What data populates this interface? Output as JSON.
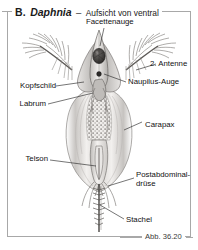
{
  "figure": {
    "panel_letter": "B.",
    "genus": "Daphnia",
    "dash": "–",
    "view": "Aufsicht von ventral",
    "caption": "Abb. 36.20",
    "style": "grayscale-scientific-illustration"
  },
  "labels": [
    {
      "key": "facettenauge",
      "text": "Facettenauge",
      "side": "top"
    },
    {
      "key": "antenne2",
      "text": "2. Antenne",
      "side": "right"
    },
    {
      "key": "naupilus_auge",
      "text": "Naupilus-Auge",
      "side": "right"
    },
    {
      "key": "kopfschild",
      "text": "Kopfschild",
      "side": "left"
    },
    {
      "key": "labrum",
      "text": "Labrum",
      "side": "left"
    },
    {
      "key": "carapax",
      "text": "Carapax",
      "side": "right"
    },
    {
      "key": "telson",
      "text": "Telson",
      "side": "left"
    },
    {
      "key": "postabdominal_1",
      "text": "Postabdominal-",
      "side": "right"
    },
    {
      "key": "postabdominal_2",
      "text": "drüse",
      "side": "right"
    },
    {
      "key": "stachel",
      "text": "Stachel",
      "side": "right"
    }
  ],
  "colors": {
    "frame": "#a8a8a8",
    "leader": "#2b2b2b",
    "text": "#111111",
    "body_light": "#e8e6e4",
    "body_mid": "#b9b6b3",
    "body_dark": "#6f6c69",
    "background": "#ffffff"
  }
}
